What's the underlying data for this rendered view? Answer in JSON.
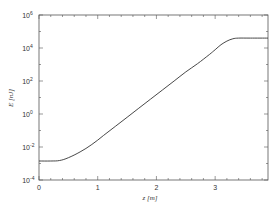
{
  "chart_data": {
    "type": "line",
    "title": "",
    "xlabel": "z [m]",
    "ylabel": "E [nJ]",
    "yscale": "log",
    "xlim": [
      0,
      3.9
    ],
    "ylim": [
      0.0001,
      1000000
    ],
    "grid": false,
    "legend": null,
    "x_ticks": [
      {
        "value": 0,
        "label": "0"
      },
      {
        "value": 1,
        "label": "1"
      },
      {
        "value": 2,
        "label": "2"
      },
      {
        "value": 3,
        "label": "3"
      }
    ],
    "y_ticks": [
      {
        "exp": -4,
        "base": "10",
        "sup": "-4"
      },
      {
        "exp": -2,
        "base": "10",
        "sup": "-2"
      },
      {
        "exp": 0,
        "base": "10",
        "sup": "0"
      },
      {
        "exp": 2,
        "base": "10",
        "sup": "2"
      },
      {
        "exp": 4,
        "base": "10",
        "sup": "4"
      },
      {
        "exp": 6,
        "base": "10",
        "sup": "6"
      }
    ],
    "series": [
      {
        "name": "pulse energy",
        "color": "#333333",
        "x": [
          0.0,
          0.2,
          0.35,
          0.5,
          0.7,
          0.9,
          1.1,
          1.3,
          1.5,
          1.7,
          1.9,
          2.1,
          2.3,
          2.5,
          2.7,
          2.9,
          3.0,
          3.1,
          3.2,
          3.3,
          3.4,
          3.6,
          3.9
        ],
        "log10_y": [
          -2.85,
          -2.85,
          -2.82,
          -2.65,
          -2.3,
          -1.85,
          -1.3,
          -0.75,
          -0.2,
          0.35,
          0.9,
          1.45,
          2.0,
          2.55,
          3.05,
          3.6,
          3.9,
          4.2,
          4.42,
          4.56,
          4.6,
          4.6,
          4.6
        ]
      }
    ]
  }
}
